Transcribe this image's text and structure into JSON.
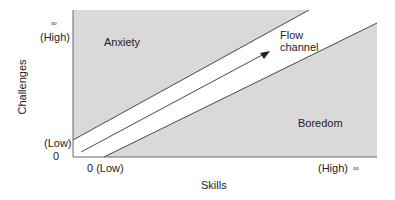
{
  "diagram": {
    "y_axis": {
      "label": "Challenges",
      "high_label": "(High)",
      "high_symbol": "∞",
      "low_label": "(Low)",
      "zero": "0"
    },
    "x_axis": {
      "label": "Skills",
      "low_label": "0 (Low)",
      "high_label": "(High)",
      "high_symbol": "∞"
    },
    "regions": {
      "anxiety": "Anxiety",
      "boredom": "Boredom",
      "flow_line1": "Flow",
      "flow_line2": "channel"
    },
    "colors": {
      "region_fill": "#d9d9d9",
      "channel_fill": "#ffffff",
      "line": "#333333"
    }
  }
}
